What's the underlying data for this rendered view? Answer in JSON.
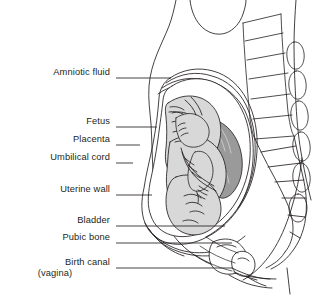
{
  "diagram": {
    "type": "medical-anatomical-illustration",
    "background_color": "#ffffff",
    "line_color": "#231f20",
    "fetus_fill": "#d8d8d8",
    "placenta_fill": "#9a9a9a",
    "amniotic_fill": "#ffffff",
    "label_color": "#231f20"
  },
  "labels": [
    {
      "id": "amniotic-fluid",
      "text": "Amniotic fluid",
      "text_x": 110,
      "text_y": 73,
      "leader_x1": 116,
      "leader_y1": 78,
      "leader_x2": 171,
      "leader_y2": 78
    },
    {
      "id": "fetus",
      "text": "Fetus",
      "text_x": 110,
      "text_y": 122,
      "leader_x1": 116,
      "leader_y1": 127,
      "leader_x2": 157,
      "leader_y2": 127
    },
    {
      "id": "placenta",
      "text": "Placenta",
      "text_x": 110,
      "text_y": 140,
      "leader_x1": 116,
      "leader_y1": 145,
      "leader_x2": 140,
      "leader_y2": 145
    },
    {
      "id": "umbilical-cord",
      "text": "Umbilical cord",
      "text_x": 110,
      "text_y": 158,
      "leader_x1": 116,
      "leader_y1": 163,
      "leader_x2": 133,
      "leader_y2": 163
    },
    {
      "id": "uterine-wall",
      "text": "Uterine wall",
      "text_x": 110,
      "text_y": 190,
      "leader_x1": 116,
      "leader_y1": 195,
      "leader_x2": 152,
      "leader_y2": 195
    },
    {
      "id": "bladder",
      "text": "Bladder",
      "text_x": 110,
      "text_y": 221,
      "leader_x1": 116,
      "leader_y1": 226,
      "leader_x2": 225,
      "leader_y2": 226
    },
    {
      "id": "pubic-bone",
      "text": "Pubic bone",
      "text_x": 110,
      "text_y": 238,
      "leader_x1": 116,
      "leader_y1": 243,
      "leader_x2": 232,
      "leader_y2": 243
    },
    {
      "id": "birth-canal",
      "text": "Birth canal",
      "subtext": "(vagina)",
      "text_x": 110,
      "text_y": 263,
      "leader_x1": 116,
      "leader_y1": 268,
      "leader_x2": 232,
      "leader_y2": 268
    }
  ],
  "structures": [
    {
      "id": "maternal-torso",
      "name": "maternal torso outline"
    },
    {
      "id": "breast",
      "name": "breast contour"
    },
    {
      "id": "lumbar-spine",
      "name": "lumbar vertebrae",
      "count": 6
    },
    {
      "id": "spinous-processes",
      "name": "spinous processes",
      "count": 6
    },
    {
      "id": "sacrum",
      "name": "sacrum and coccyx",
      "count": 5
    },
    {
      "id": "uterus",
      "name": "uterine wall layers",
      "count": 4
    },
    {
      "id": "fetus",
      "name": "fetus in vertex presentation"
    },
    {
      "id": "placenta",
      "name": "placenta posterior"
    },
    {
      "id": "umbilical-cord",
      "name": "umbilical cord"
    },
    {
      "id": "bladder",
      "name": "urinary bladder"
    },
    {
      "id": "pubic-bone",
      "name": "pubic symphysis"
    },
    {
      "id": "birth-canal",
      "name": "vaginal canal"
    },
    {
      "id": "thigh",
      "name": "thigh and buttock contour"
    }
  ]
}
